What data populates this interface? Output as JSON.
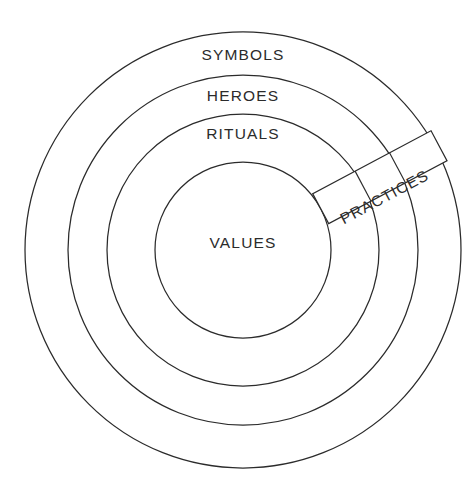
{
  "diagram": {
    "type": "concentric-rings",
    "background_color": "#ffffff",
    "stroke_color": "#2b2b2b",
    "text_color": "#2b2b2b",
    "center": {
      "x": 243,
      "y": 250
    },
    "rings": [
      {
        "label": "SYMBOLS",
        "level": 1,
        "radius": 218,
        "label_x": 243,
        "label_y": 56
      },
      {
        "label": "HEROES",
        "level": 2,
        "radius": 175,
        "label_x": 243,
        "label_y": 97
      },
      {
        "label": "RITUALS",
        "level": 3,
        "radius": 136,
        "label_x": 243,
        "label_y": 135
      },
      {
        "label": "VALUES",
        "level": 4,
        "radius": 88,
        "label_x": 243,
        "label_y": 244
      }
    ],
    "band": {
      "label": "PRACTICES",
      "rotation_deg": -28,
      "inner_radius": 88,
      "outer_radius": 222,
      "thickness": 34,
      "label_x": 385,
      "label_y": 198,
      "divider_radii": [
        136,
        175
      ]
    }
  }
}
